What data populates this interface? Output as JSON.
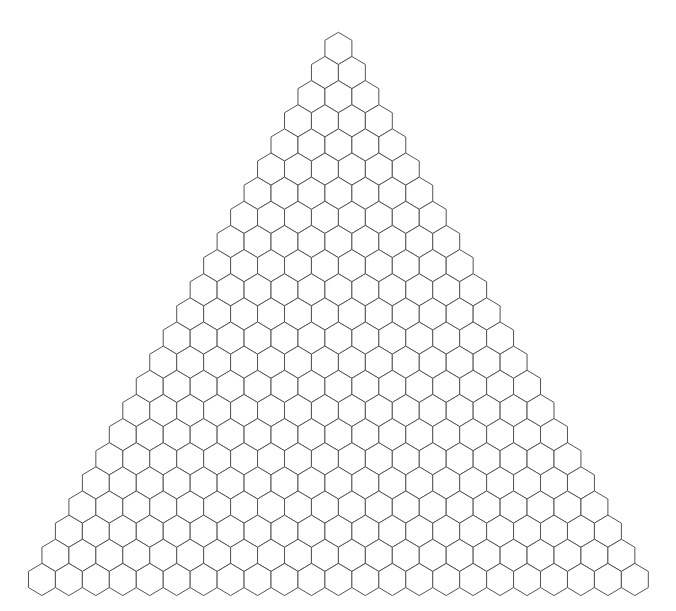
{
  "diagram": {
    "type": "hexagonal-triangle-grid",
    "rows": 23,
    "orientation": "pointy-top",
    "apex_center_x": 338.4,
    "apex_top_y": 32.3,
    "hex_width": 26.95,
    "hex_height": 32.2,
    "row_spacing": 24.14,
    "colors": {
      "background": "#ffffff",
      "stroke": "#555555",
      "fill": "#ffffff"
    }
  }
}
